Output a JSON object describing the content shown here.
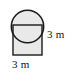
{
  "figure": {
    "type": "geometry-diagram",
    "shapes": [
      {
        "name": "square",
        "kind": "square",
        "side_length": 3,
        "unit": "m",
        "x": 13,
        "y": 25,
        "width": 29,
        "height": 30,
        "fill": "#e9e9e9",
        "stroke": "#1a1a1a",
        "stroke_width": 1.4
      },
      {
        "name": "circle",
        "kind": "circle",
        "diameter": 3,
        "unit": "m",
        "cx": 27.5,
        "cy": 26.5,
        "r": 16.2,
        "fill": "#e9e9e9",
        "stroke": "#1a1a1a",
        "stroke_width": 1.4
      }
    ],
    "labels": [
      {
        "name": "right-dimension",
        "text": "3 m",
        "value": 3,
        "unit": "m",
        "position": "right"
      },
      {
        "name": "bottom-dimension",
        "text": "3 m",
        "value": 3,
        "unit": "m",
        "position": "bottom"
      }
    ],
    "colors": {
      "fill": "#e9e9e9",
      "stroke": "#1a1a1a",
      "background": "#ffffff",
      "text": "#111111"
    }
  }
}
